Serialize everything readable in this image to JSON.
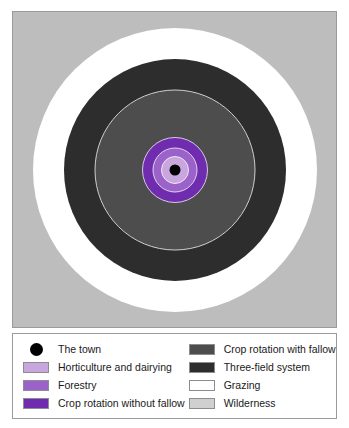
{
  "figure": {
    "background_color": "#ffffff",
    "border_color": "#9a9a9a"
  },
  "map": {
    "background_color": "#bdbdbd",
    "center_label": "The town"
  },
  "chart_data": {
    "type": "pie",
    "subtype": "concentric-rings",
    "xlabel": "",
    "ylabel": "",
    "categories": [
      "The town",
      "Horticulture and dairying",
      "Forestry",
      "Crop rotation without fallow",
      "Crop rotation with fallow",
      "Three-field system",
      "Grazing",
      "Wilderness"
    ],
    "values": [
      11,
      28,
      45,
      66,
      161,
      222,
      284,
      317
    ],
    "value_unit": "ring diameter (px)",
    "colors": [
      "#000000",
      "#c9a6dd",
      "#9b63c9",
      "#6f2cae",
      "#4d4d4d",
      "#2d2d2d",
      "#ffffff",
      "#bdbdbd"
    ],
    "legend_position": "bottom",
    "grid": false
  },
  "rings": {
    "wilderness": {
      "name": "Wilderness",
      "color": "#bdbdbd"
    },
    "grazing": {
      "name": "Grazing",
      "color": "#ffffff"
    },
    "three_field": {
      "name": "Three-field system",
      "color": "#2d2d2d"
    },
    "fallow": {
      "name": "Crop rotation with fallow",
      "color": "#4d4d4d"
    },
    "no_fallow": {
      "name": "Crop rotation without fallow",
      "color": "#6f2cae"
    },
    "forestry": {
      "name": "Forestry",
      "color": "#9b63c9"
    },
    "horticulture": {
      "name": "Horticulture and dairying",
      "color": "#c9a6dd"
    },
    "town": {
      "name": "The town",
      "color": "#000000"
    }
  },
  "legend": {
    "left_column": [
      {
        "label": "The town",
        "color": "#000000",
        "shape": "circle"
      },
      {
        "label": "Horticulture and dairying",
        "color": "#c9a6dd",
        "shape": "rect"
      },
      {
        "label": "Forestry",
        "color": "#9b63c9",
        "shape": "rect"
      },
      {
        "label": "Crop rotation without fallow",
        "color": "#6f2cae",
        "shape": "rect"
      }
    ],
    "right_column": [
      {
        "label": "Crop rotation with fallow",
        "color": "#4d4d4d",
        "shape": "rect"
      },
      {
        "label": "Three-field system",
        "color": "#2d2d2d",
        "shape": "rect"
      },
      {
        "label": "Grazing",
        "color": "#ffffff",
        "shape": "rect"
      },
      {
        "label": "Wilderness",
        "color": "#d0d0d0",
        "shape": "rect"
      }
    ]
  }
}
